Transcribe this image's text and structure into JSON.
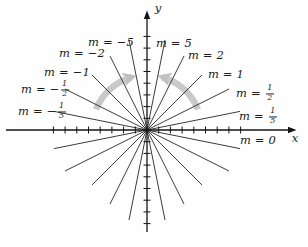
{
  "figure_title": "Lines through the origin with slope m",
  "colors": {
    "axes": "#141414",
    "slope_lines": "#3d3d3d",
    "arc_band": "#c7c7c7",
    "arc_arrowhead": "#bdbdbd",
    "text": "#1c1c1c",
    "background": "#fefefe"
  },
  "chart_data": {
    "type": "line",
    "slopes": [
      5,
      2,
      1,
      0.5,
      0.2,
      0,
      -0.2,
      -0.5,
      -1,
      -2,
      -5
    ],
    "slope_label_texts": [
      "m = 5",
      "m = 2",
      "m = 1",
      "m = 1/2",
      "m = 1/5",
      "m = 0",
      "m = −1/5",
      "m = −1/2",
      "m = −1",
      "m = −2",
      "m = −5"
    ],
    "xlabel": "x",
    "ylabel": "y",
    "grid": false,
    "axis_style": "centered axes with arrowheads on positive ends, unlabeled tick marks",
    "ticks_per_side": 8,
    "annotations": [
      "gray arc arrow left of y-axis pointing toward vertical",
      "gray arc arrow right of y-axis pointing toward vertical"
    ]
  },
  "labels": [
    {
      "name": "label-m-neg-5",
      "text": "m = −5",
      "x": 111,
      "y": 43
    },
    {
      "name": "label-m-5",
      "text": "m = 5",
      "x": 174,
      "y": 44
    },
    {
      "name": "label-m-neg-2",
      "text": "m = −2",
      "x": 82,
      "y": 54
    },
    {
      "name": "label-m-2",
      "text": "m = 2",
      "x": 206,
      "y": 56
    },
    {
      "name": "label-m-neg-1",
      "text": "m = −1",
      "x": 67,
      "y": 73
    },
    {
      "name": "label-m-1",
      "text": "m = 1",
      "x": 226,
      "y": 75
    },
    {
      "name": "label-m-neg-half",
      "before": "m = −",
      "num": "1",
      "den": "2",
      "x": 45,
      "y": 90
    },
    {
      "name": "label-m-half",
      "before": "m = ",
      "num": "1",
      "den": "2",
      "x": 255,
      "y": 94
    },
    {
      "name": "label-m-neg-fifth",
      "before": "m = −",
      "num": "1",
      "den": "5",
      "x": 42,
      "y": 112
    },
    {
      "name": "label-m-fifth",
      "before": "m = ",
      "num": "1",
      "den": "5",
      "x": 258,
      "y": 117
    },
    {
      "name": "label-m-0",
      "text": "m = 0",
      "x": 258,
      "y": 141
    },
    {
      "name": "label-x-axis",
      "text": "x",
      "x": 295,
      "y": 139
    },
    {
      "name": "label-y-axis",
      "text": "y",
      "x": 158,
      "y": 9
    }
  ]
}
